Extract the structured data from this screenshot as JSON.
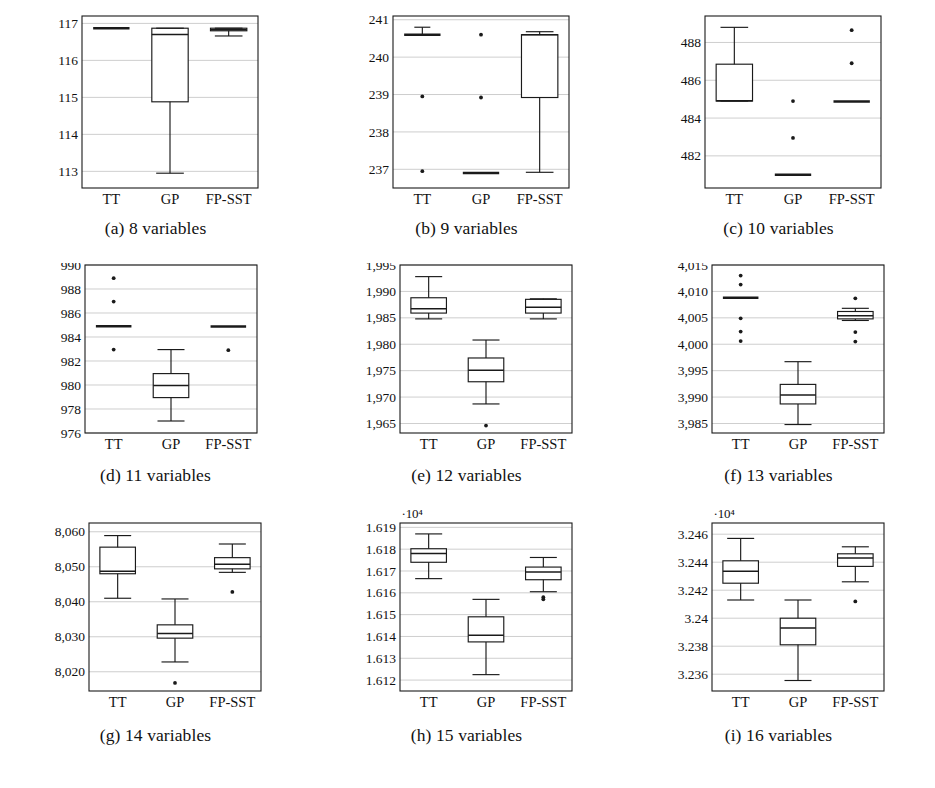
{
  "figure": {
    "categories": [
      "TT",
      "GP",
      "FP-SST"
    ],
    "panels": [
      {
        "key": "a",
        "caption": "(a) 8 variables",
        "exponent_label": "",
        "ylim": [
          112.55,
          117.2
        ],
        "yticks": [
          113,
          114,
          115,
          116,
          117
        ],
        "ytick_labels": [
          "113",
          "114",
          "115",
          "116",
          "117"
        ]
      },
      {
        "key": "b",
        "caption": "(b) 9 variables",
        "exponent_label": "",
        "ylim": [
          236.5,
          241.1
        ],
        "yticks": [
          237,
          238,
          239,
          240,
          241
        ],
        "ytick_labels": [
          "237",
          "238",
          "239",
          "240",
          "241"
        ]
      },
      {
        "key": "c",
        "caption": "(c) 10 variables",
        "exponent_label": "",
        "ylim": [
          480.3,
          489.4
        ],
        "yticks": [
          482,
          484,
          486,
          488
        ],
        "ytick_labels": [
          "482",
          "484",
          "486",
          "488"
        ]
      },
      {
        "key": "d",
        "caption": "(d) 11 variables",
        "exponent_label": "",
        "ylim": [
          976,
          990
        ],
        "yticks": [
          976,
          978,
          980,
          982,
          984,
          986,
          988,
          990
        ],
        "ytick_labels": [
          "976",
          "978",
          "980",
          "982",
          "984",
          "986",
          "988",
          "990"
        ]
      },
      {
        "key": "e",
        "caption": "(e) 12 variables",
        "exponent_label": "",
        "ylim": [
          1963.2,
          1995
        ],
        "yticks": [
          1965,
          1970,
          1975,
          1980,
          1985,
          1990,
          1995
        ],
        "ytick_labels": [
          "1,965",
          "1,970",
          "1,975",
          "1,980",
          "1,985",
          "1,990",
          "1,995"
        ]
      },
      {
        "key": "f",
        "caption": "(f) 13 variables",
        "exponent_label": "",
        "ylim": [
          3983.2,
          4015
        ],
        "yticks": [
          3985,
          3990,
          3995,
          4000,
          4005,
          4010,
          4015
        ],
        "ytick_labels": [
          "3,985",
          "3,990",
          "3,995",
          "4,000",
          "4,005",
          "4,010",
          "4,015"
        ]
      },
      {
        "key": "g",
        "caption": "(g) 14 variables",
        "exponent_label": "",
        "ylim": [
          8014.5,
          8062.5
        ],
        "yticks": [
          8020,
          8030,
          8040,
          8050,
          8060
        ],
        "ytick_labels": [
          "8,020",
          "8,030",
          "8,040",
          "8,050",
          "8,060"
        ]
      },
      {
        "key": "h",
        "caption": "(h) 15 variables",
        "exponent_label": "·10⁴",
        "ylim": [
          16115,
          16192
        ],
        "yticks": [
          16120,
          16130,
          16140,
          16150,
          16160,
          16170,
          16180,
          16190
        ],
        "ytick_labels": [
          "1.612",
          "1.613",
          "1.614",
          "1.615",
          "1.616",
          "1.617",
          "1.618",
          "1.619"
        ]
      },
      {
        "key": "i",
        "caption": "(i) 16 variables",
        "exponent_label": "·10⁴",
        "ylim": [
          32348,
          32468
        ],
        "yticks": [
          32360,
          32380,
          32400,
          32420,
          32440,
          32460
        ],
        "ytick_labels": [
          "3.236",
          "3.238",
          "3.24",
          "3.242",
          "3.244",
          "3.246"
        ]
      }
    ]
  },
  "chart_data": {
    "type": "box",
    "title": "",
    "xlabel": "",
    "ylabel": "",
    "grid": true,
    "legend": "none",
    "groups": [
      "TT",
      "GP",
      "FP-SST"
    ],
    "panels": [
      {
        "id": "a",
        "caption": "(a) 8 variables",
        "ylim": [
          112.55,
          117.2
        ],
        "yticks": [
          113,
          114,
          115,
          116,
          117
        ],
        "boxes": [
          {
            "name": "TT",
            "min": 116.87,
            "q1": 116.87,
            "median": 116.87,
            "q3": 116.87,
            "max": 116.87,
            "outliers": [],
            "degenerate": true
          },
          {
            "name": "GP",
            "min": 112.95,
            "q1": 114.88,
            "median": 116.7,
            "q3": 116.87,
            "max": 116.87,
            "outliers": [],
            "degenerate": false
          },
          {
            "name": "FP-SST",
            "min": 116.66,
            "q1": 116.8,
            "median": 116.83,
            "q3": 116.87,
            "max": 116.87,
            "outliers": [],
            "degenerate": false
          }
        ]
      },
      {
        "id": "b",
        "caption": "(b) 9 variables",
        "ylim": [
          236.5,
          241.1
        ],
        "yticks": [
          237,
          238,
          239,
          240,
          241
        ],
        "boxes": [
          {
            "name": "TT",
            "min": 240.6,
            "q1": 240.6,
            "median": 240.6,
            "q3": 240.62,
            "max": 240.8,
            "outliers": [
              238.95,
              236.95
            ],
            "degenerate": true
          },
          {
            "name": "GP",
            "min": 236.9,
            "q1": 236.9,
            "median": 236.9,
            "q3": 236.9,
            "max": 236.9,
            "outliers": [
              240.6,
              238.92
            ],
            "degenerate": true
          },
          {
            "name": "FP-SST",
            "min": 236.92,
            "q1": 238.92,
            "median": 240.6,
            "q3": 240.6,
            "max": 240.68,
            "outliers": [],
            "degenerate": false
          }
        ]
      },
      {
        "id": "c",
        "caption": "(c) 10 variables",
        "ylim": [
          480.3,
          489.4
        ],
        "yticks": [
          482,
          484,
          486,
          488
        ],
        "boxes": [
          {
            "name": "TT",
            "min": 484.9,
            "q1": 484.9,
            "median": 484.92,
            "q3": 486.85,
            "max": 488.8,
            "outliers": [],
            "degenerate": false
          },
          {
            "name": "GP",
            "min": 481.0,
            "q1": 481.0,
            "median": 481.0,
            "q3": 481.0,
            "max": 481.0,
            "outliers": [
              484.9,
              482.95
            ],
            "degenerate": true
          },
          {
            "name": "FP-SST",
            "min": 484.88,
            "q1": 484.88,
            "median": 484.88,
            "q3": 484.88,
            "max": 484.88,
            "outliers": [
              488.65,
              486.9
            ],
            "degenerate": true
          }
        ]
      },
      {
        "id": "d",
        "caption": "(d) 11 variables",
        "ylim": [
          976,
          990
        ],
        "yticks": [
          976,
          978,
          980,
          982,
          984,
          986,
          988,
          990
        ],
        "boxes": [
          {
            "name": "TT",
            "min": 984.9,
            "q1": 984.9,
            "median": 984.9,
            "q3": 984.9,
            "max": 984.9,
            "outliers": [
              988.9,
              986.95,
              982.95
            ],
            "degenerate": true
          },
          {
            "name": "GP",
            "min": 977.0,
            "q1": 978.95,
            "median": 979.95,
            "q3": 980.95,
            "max": 982.95,
            "outliers": [],
            "degenerate": false
          },
          {
            "name": "FP-SST",
            "min": 984.88,
            "q1": 984.88,
            "median": 984.88,
            "q3": 984.88,
            "max": 984.88,
            "outliers": [
              982.9
            ],
            "degenerate": true
          }
        ]
      },
      {
        "id": "e",
        "caption": "(e) 12 variables",
        "ylim": [
          1963.2,
          1995
        ],
        "yticks": [
          1965,
          1970,
          1975,
          1980,
          1985,
          1990,
          1995
        ],
        "boxes": [
          {
            "name": "TT",
            "min": 1984.8,
            "q1": 1985.9,
            "median": 1986.7,
            "q3": 1988.8,
            "max": 1992.8,
            "outliers": [],
            "degenerate": false
          },
          {
            "name": "GP",
            "min": 1968.7,
            "q1": 1972.9,
            "median": 1975.1,
            "q3": 1977.4,
            "max": 1980.8,
            "outliers": [
              1964.6
            ],
            "degenerate": false
          },
          {
            "name": "FP-SST",
            "min": 1984.8,
            "q1": 1985.9,
            "median": 1987.0,
            "q3": 1988.5,
            "max": 1988.6,
            "outliers": [],
            "degenerate": false
          }
        ]
      },
      {
        "id": "f",
        "caption": "(f) 13 variables",
        "ylim": [
          3983.2,
          4015
        ],
        "yticks": [
          3985,
          3990,
          3995,
          4000,
          4005,
          4010,
          4015
        ],
        "boxes": [
          {
            "name": "TT",
            "min": 4008.8,
            "q1": 4008.8,
            "median": 4008.8,
            "q3": 4008.8,
            "max": 4008.8,
            "outliers": [
              4013.0,
              4011.3,
              4004.9,
              4002.4,
              4000.6
            ],
            "degenerate": true
          },
          {
            "name": "GP",
            "min": 3984.8,
            "q1": 3988.7,
            "median": 3990.4,
            "q3": 3992.4,
            "max": 3996.7,
            "outliers": [],
            "degenerate": false
          },
          {
            "name": "FP-SST",
            "min": 4004.5,
            "q1": 4004.8,
            "median": 4005.4,
            "q3": 4006.2,
            "max": 4006.8,
            "outliers": [
              4008.7,
              4002.3,
              4000.5
            ],
            "degenerate": false
          }
        ]
      },
      {
        "id": "g",
        "caption": "(g) 14 variables",
        "ylim": [
          8014.5,
          8062.5
        ],
        "yticks": [
          8020,
          8030,
          8040,
          8050,
          8060
        ],
        "boxes": [
          {
            "name": "TT",
            "min": 8041.0,
            "q1": 8048.0,
            "median": 8048.7,
            "q3": 8055.6,
            "max": 8058.9,
            "outliers": [],
            "degenerate": false
          },
          {
            "name": "GP",
            "min": 8022.8,
            "q1": 8029.6,
            "median": 8030.9,
            "q3": 8033.4,
            "max": 8040.8,
            "outliers": [
              8016.8
            ],
            "degenerate": false
          },
          {
            "name": "FP-SST",
            "min": 8048.4,
            "q1": 8049.4,
            "median": 8050.7,
            "q3": 8052.6,
            "max": 8056.5,
            "outliers": [
              8042.8
            ],
            "degenerate": false
          }
        ]
      },
      {
        "id": "h",
        "caption": "(h) 15 variables",
        "ylim": [
          16115,
          16192
        ],
        "yticks": [
          16120,
          16130,
          16140,
          16150,
          16160,
          16170,
          16180,
          16190
        ],
        "boxes": [
          {
            "name": "TT",
            "min": 16166.5,
            "q1": 16174.0,
            "median": 16178.0,
            "q3": 16180.2,
            "max": 16187.0,
            "outliers": [],
            "degenerate": false
          },
          {
            "name": "GP",
            "min": 16122.5,
            "q1": 16137.5,
            "median": 16140.5,
            "q3": 16149.0,
            "max": 16157.0,
            "outliers": [],
            "degenerate": false
          },
          {
            "name": "FP-SST",
            "min": 16160.5,
            "q1": 16166.0,
            "median": 16169.5,
            "q3": 16171.8,
            "max": 16176.2,
            "outliers": [
              16158.0,
              16157.0
            ],
            "degenerate": false
          }
        ]
      },
      {
        "id": "i",
        "caption": "(i) 16 variables",
        "ylim": [
          32348,
          32468
        ],
        "yticks": [
          32360,
          32380,
          32400,
          32420,
          32440,
          32460
        ],
        "boxes": [
          {
            "name": "TT",
            "min": 32413.0,
            "q1": 32425.0,
            "median": 32433.5,
            "q3": 32441.0,
            "max": 32457.0,
            "outliers": [],
            "degenerate": false
          },
          {
            "name": "GP",
            "min": 32355.5,
            "q1": 32381.0,
            "median": 32393.0,
            "q3": 32400.0,
            "max": 32413.0,
            "outliers": [],
            "degenerate": false
          },
          {
            "name": "FP-SST",
            "min": 32426.0,
            "q1": 32437.0,
            "median": 32443.0,
            "q3": 32446.0,
            "max": 32451.0,
            "outliers": [
              32412.0
            ],
            "degenerate": false
          }
        ]
      }
    ]
  }
}
